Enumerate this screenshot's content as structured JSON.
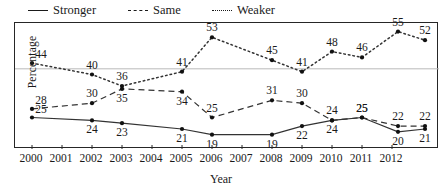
{
  "legend": {
    "items": [
      {
        "label": "Stronger",
        "style": "solid",
        "icon": "line-solid-icon"
      },
      {
        "label": "Same",
        "style": "dashed",
        "icon": "line-dashed-icon"
      },
      {
        "label": "Weaker",
        "style": "dotted",
        "icon": "line-dotted-icon"
      }
    ]
  },
  "axes": {
    "ylabel": "Percentage",
    "xlabel": "Year"
  },
  "chart_data": {
    "type": "line",
    "title": "",
    "xlabel": "Year",
    "ylabel": "Percentage",
    "x_tick_labels": [
      "2000",
      "2001",
      "2002",
      "2003",
      "2004",
      "2005",
      "2006",
      "2007",
      "2008",
      "2009",
      "2010",
      "2011",
      "2012"
    ],
    "x": [
      2000,
      2002,
      2003,
      2005,
      2006,
      2008,
      2009,
      2010,
      2011,
      2012.2,
      2013.1
    ],
    "xlim": [
      1999.6,
      2013.4
    ],
    "ylim": [
      14,
      58
    ],
    "grid": "single horizontal gridline at y=42",
    "gridlines": [
      42
    ],
    "legend_position": "above-plot-left",
    "data_labels": true,
    "series": [
      {
        "name": "Stronger",
        "style": "solid",
        "color": "#333333",
        "values": [
          25,
          24,
          23,
          21,
          19,
          19,
          22,
          24,
          25,
          20,
          21
        ],
        "label_positions": [
          "above-left",
          "below",
          "below",
          "below",
          "below",
          "below",
          "below",
          "below",
          "above",
          "below",
          "below"
        ]
      },
      {
        "name": "Same",
        "style": "dashed",
        "color": "#333333",
        "values": [
          28,
          30,
          35,
          34,
          25,
          31,
          30,
          24,
          25,
          22,
          22
        ],
        "label_positions": [
          "above-left",
          "above",
          "below",
          "below",
          "above",
          "above",
          "above",
          "above",
          "above",
          "above",
          "above"
        ]
      },
      {
        "name": "Weaker",
        "style": "dotted",
        "color": "#333333",
        "values": [
          44,
          40,
          36,
          41,
          53,
          45,
          41,
          48,
          46,
          55,
          52
        ],
        "label_positions": [
          "above-left",
          "above",
          "above",
          "above",
          "above",
          "above",
          "above",
          "above",
          "above",
          "above",
          "above"
        ]
      }
    ]
  },
  "colors": {
    "ink": "#1a1a1a",
    "line": "#333333",
    "frame": "#262626",
    "grid": "#b9b9b9",
    "background": "#ffffff"
  }
}
